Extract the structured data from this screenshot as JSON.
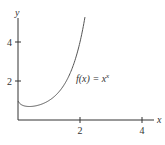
{
  "chart_data": {
    "type": "line",
    "title": "",
    "xlabel": "x",
    "ylabel": "y",
    "xlim": [
      0,
      4.4
    ],
    "ylim": [
      0,
      5.2
    ],
    "x_ticks": [
      2,
      4
    ],
    "x_tick_labels": [
      "2",
      "4"
    ],
    "y_ticks": [
      2,
      4
    ],
    "y_tick_labels": [
      "2",
      "4"
    ],
    "grid": false,
    "series": [
      {
        "name": "f(x) = x^x",
        "function": "x^x",
        "x_range": [
          0,
          2.16
        ],
        "x": [
          0.01,
          0.1,
          0.2,
          0.3,
          0.368,
          0.5,
          0.75,
          1.0,
          1.25,
          1.5,
          1.75,
          2.0,
          2.16
        ],
        "y": [
          0.955,
          0.794,
          0.725,
          0.697,
          0.692,
          0.707,
          0.806,
          1.0,
          1.322,
          1.837,
          2.664,
          4.0,
          5.28
        ]
      }
    ],
    "annotations": [
      {
        "text_func": "f(x) = x",
        "text_exp": "x"
      }
    ]
  }
}
